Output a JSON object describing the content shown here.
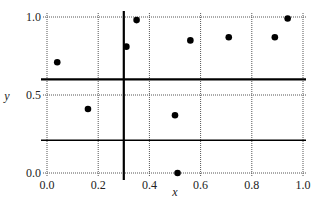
{
  "chart_data": {
    "type": "scatter",
    "title": "",
    "xlabel": "x",
    "ylabel": "y",
    "xlim": [
      0,
      1
    ],
    "ylim": [
      0,
      1
    ],
    "grid": true,
    "x_ticks": [
      "0.0",
      "0.2",
      "0.4",
      "0.6",
      "0.8",
      "1.0"
    ],
    "y_ticks": [
      "0.0",
      "0.5",
      "1.0"
    ],
    "points": [
      {
        "x": 0.04,
        "y": 0.71
      },
      {
        "x": 0.16,
        "y": 0.41
      },
      {
        "x": 0.31,
        "y": 0.81
      },
      {
        "x": 0.35,
        "y": 0.98
      },
      {
        "x": 0.56,
        "y": 0.85
      },
      {
        "x": 0.71,
        "y": 0.87
      },
      {
        "x": 0.89,
        "y": 0.87
      },
      {
        "x": 0.94,
        "y": 0.99
      },
      {
        "x": 0.5,
        "y": 0.37
      },
      {
        "x": 0.51,
        "y": 0.0
      }
    ],
    "split_lines": [
      {
        "orientation": "vertical",
        "value": 0.3,
        "weight": "thick"
      },
      {
        "orientation": "horizontal",
        "value": 0.6,
        "weight": "thick",
        "span": "full"
      },
      {
        "orientation": "horizontal",
        "value": 0.21,
        "weight": "medium",
        "span": "x>=0.30"
      }
    ]
  }
}
